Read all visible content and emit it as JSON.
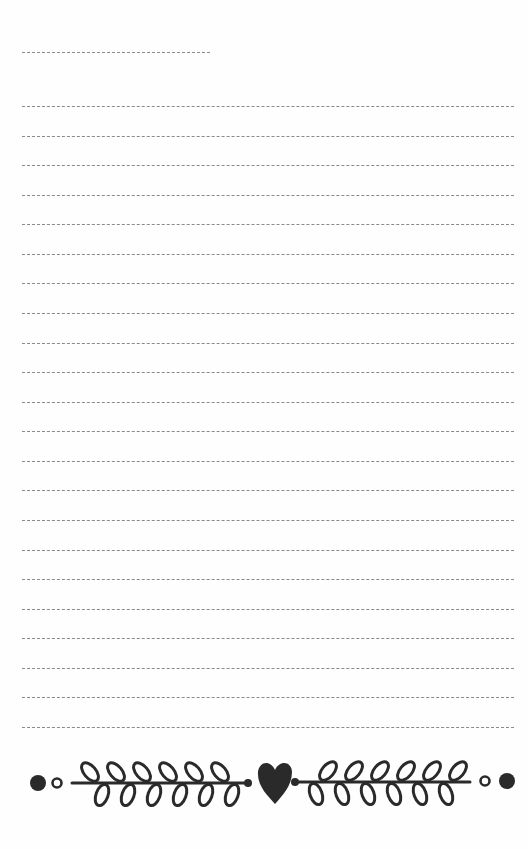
{
  "page": {
    "type": "notepad-sheet",
    "background": "#fefefe",
    "line_color": "#8a8a8a",
    "ink_color": "#2a2a2a"
  },
  "header_line": {
    "x1": 22,
    "x2": 210,
    "y": 52
  },
  "ruled_lines": {
    "count": 22,
    "x1": 22,
    "x2": 514,
    "first_y": 106,
    "spacing": 29.57
  },
  "ornament": {
    "description": "Laurel branches with heart and dots",
    "stem_y": 783,
    "left_filled_dot": {
      "cx": 38,
      "cy": 783,
      "r": 8
    },
    "left_hollow_dot": {
      "cx": 57,
      "cy": 783,
      "r": 5
    },
    "left_stem": {
      "x1": 72,
      "x2": 248
    },
    "heart": {
      "cx": 275,
      "cy": 780
    },
    "right_stem": {
      "x1": 294,
      "x2": 470
    },
    "right_hollow_dot": {
      "cx": 485,
      "cy": 781,
      "r": 5
    },
    "right_filled_dot": {
      "cx": 507,
      "cy": 781,
      "r": 8
    },
    "leaf_pairs_per_branch": 6
  }
}
